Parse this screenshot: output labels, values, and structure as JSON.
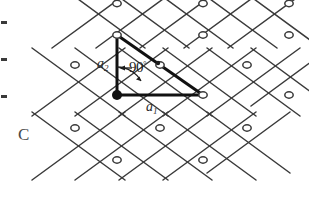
{
  "figure": {
    "panel_letter": "C",
    "caption_kind": "centered-rectangular-lattice",
    "background_color": "#ffffff",
    "line_color": "#3a3a3a",
    "highlight_color": "#111111",
    "labels": {
      "a1": "a",
      "a1_sub": "1",
      "a2": "a",
      "a2_sub": "2",
      "angle": "90",
      "angle_degree_symbol": "°"
    }
  },
  "edge_ticks": [
    {
      "name": "edge-tick-1",
      "x": 1,
      "y": 21,
      "w": 6,
      "h": 3
    },
    {
      "name": "edge-tick-2",
      "x": 1,
      "y": 58,
      "w": 6,
      "h": 3
    },
    {
      "name": "edge-tick-3",
      "x": 1,
      "y": 95,
      "w": 6,
      "h": 3
    }
  ],
  "chart_data": {
    "type": "scatter",
    "xlabel": "",
    "ylabel": "",
    "lattice": {
      "row_spacing_px": 31.5,
      "col_spacing_px": 86,
      "row_offset_px": 43,
      "origin_px": [
        117,
        95
      ],
      "a1_vector_px": [
        86,
        0
      ],
      "a2_vector_px": [
        0,
        -60
      ],
      "angle_between_deg": 90
    },
    "node_rows": [
      {
        "y": 3.5,
        "xs": [
          117,
          203,
          289
        ],
        "row": "A"
      },
      {
        "y": 35,
        "xs": [
          117,
          203,
          289
        ],
        "row": "A"
      },
      {
        "y": 65,
        "xs": [
          75,
          160,
          247
        ],
        "row": "B"
      },
      {
        "y": 95,
        "xs": [
          117,
          203,
          289
        ],
        "row": "A"
      },
      {
        "y": 128,
        "xs": [
          75,
          160,
          247
        ],
        "row": "B"
      },
      {
        "y": 160,
        "xs": [
          117,
          203
        ],
        "row": "A"
      }
    ],
    "filled_node_px": [
      117,
      95
    ],
    "open_node_radius_px": 3.2,
    "filled_node_radius_px": 5.0,
    "grid": false,
    "legend": "none"
  }
}
